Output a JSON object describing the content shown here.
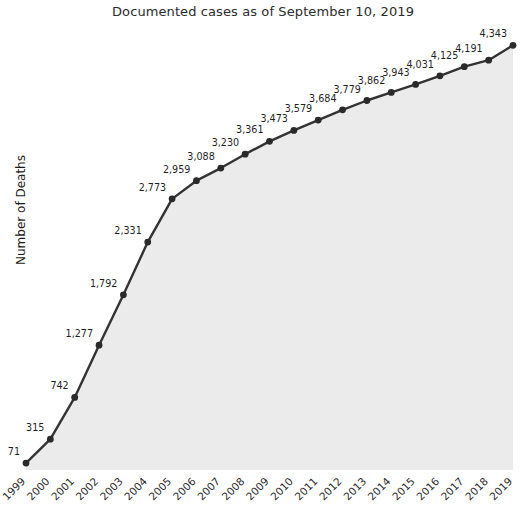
{
  "chart_data": {
    "type": "line",
    "title": "Documented cases as of September 10, 2019",
    "xlabel": "",
    "ylabel": "Number of Deaths",
    "categories": [
      "1999",
      "2000",
      "2001",
      "2002",
      "2003",
      "2004",
      "2005",
      "2006",
      "2007",
      "2008",
      "2009",
      "2010",
      "2011",
      "2012",
      "2013",
      "2014",
      "2015",
      "2016",
      "2017",
      "2018",
      "2019"
    ],
    "values": [
      71,
      315,
      742,
      1277,
      1792,
      2331,
      2773,
      2959,
      3088,
      3230,
      3361,
      3473,
      3579,
      3684,
      3779,
      3862,
      3943,
      4031,
      4125,
      4191,
      4343
    ],
    "value_labels": [
      "71",
      "315",
      "742",
      "1,277",
      "1,792",
      "2,331",
      "2,773",
      "2,959",
      "3,088",
      "3,230",
      "3,361",
      "3,473",
      "3,579",
      "3,684",
      "3,779",
      "3,862",
      "3,943",
      "4,031",
      "4,125",
      "4,191",
      "4,343"
    ],
    "ylim": [
      0,
      4500
    ],
    "grid": true,
    "legend": null,
    "series_name": "Number of Deaths",
    "marker": "circle",
    "fill": true,
    "colors": {
      "line": "#333333",
      "marker": "#2a2a2a",
      "area_fill": "#ebebeb",
      "gridline": "#ffffff",
      "text": "#1f1f1f",
      "title": "#2b2b2b",
      "background": "#ffffff"
    },
    "xtick_rotation": -45
  }
}
